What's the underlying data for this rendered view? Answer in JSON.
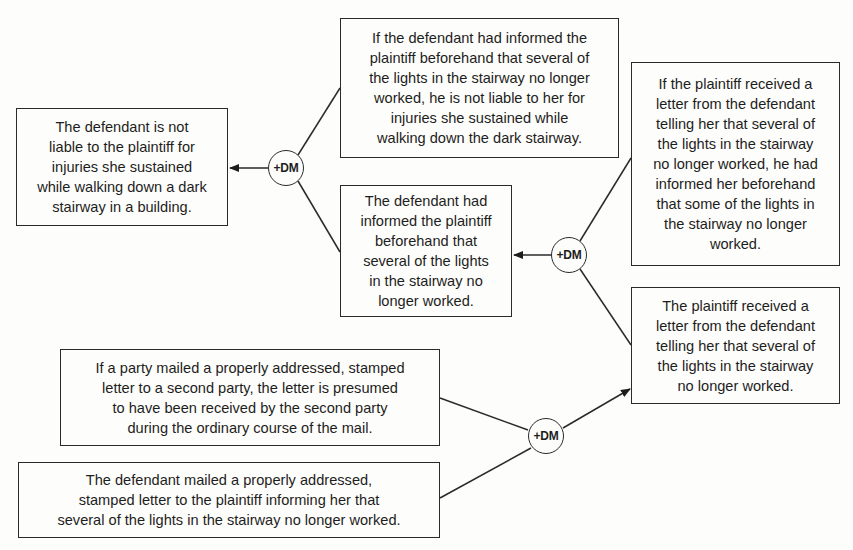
{
  "diagram": {
    "type": "argument-map",
    "nodes": {
      "conclusion": "The defendant is not\nliable to the plaintiff for\ninjuries she sustained\nwhile walking down a dark\nstairway in a building.",
      "rule_notice": "If the defendant had informed the\nplaintiff  beforehand that several of\nthe lights in the stairway no longer\nworked, he is not liable to her for\ninjuries she sustained while\nwalking down the dark stairway.",
      "fact_informed": "The defendant had\ninformed the plaintiff\nbeforehand that\nseveral of the lights\nin the stairway no\nlonger worked.",
      "rule_letter_received": "If the plaintiff received a\nletter from the defendant\ntelling her that several of\nthe lights in the stairway\nno longer worked, he had\ninformed her beforehand\nthat some of the lights in\nthe stairway no longer\nworked.",
      "fact_letter_received": "The plaintiff received a\nletter from the defendant\ntelling her that several of\nthe lights in the stairway\nno longer worked.",
      "rule_mailbox": "If a party mailed a properly addressed, stamped\nletter to a second party, the letter is presumed\nto have been received by the second party\nduring the ordinary course of the mail.",
      "fact_mailed": "The defendant mailed a properly addressed,\nstamped letter to the plaintiff informing her that\nseveral of the lights in the stairway no longer worked."
    },
    "connectors": [
      {
        "label": "+DM",
        "inputs": [
          "rule_notice",
          "fact_informed"
        ],
        "output": "conclusion"
      },
      {
        "label": "+DM",
        "inputs": [
          "rule_letter_received",
          "fact_letter_received"
        ],
        "output": "fact_informed"
      },
      {
        "label": "+DM",
        "inputs": [
          "rule_mailbox",
          "fact_mailed"
        ],
        "output": "fact_letter_received"
      }
    ]
  }
}
